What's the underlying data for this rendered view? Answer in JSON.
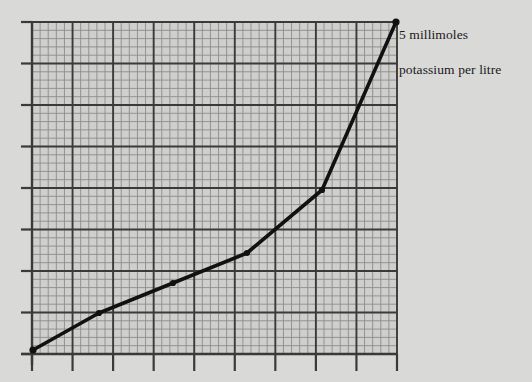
{
  "figure": {
    "background_color": "#d9d9d7",
    "grid_fill_color": "#cfcfcd",
    "major_grid_color": "#3a3a3a",
    "minor_grid_color": "#8c8c8a",
    "curve_color": "#111111",
    "annotation_lines": [
      "5 millimoles",
      "potassium per litre"
    ]
  },
  "chart_data": {
    "type": "line",
    "title": "",
    "xlabel": "",
    "ylabel": "",
    "annotation": "5 millimoles potassium per litre",
    "grid": true,
    "legend": "none",
    "xlim": [
      0,
      9
    ],
    "ylim": [
      0,
      8
    ],
    "major_cells_x": 9,
    "major_cells_y": 8,
    "minor_divisions_per_cell": 5,
    "x": [
      0.05,
      1.65,
      3.45,
      5.25,
      7.05,
      8.9
    ],
    "y": [
      0.1,
      0.95,
      1.7,
      2.45,
      3.95,
      8.0
    ],
    "points_px": [
      {
        "x": 33,
        "y": 350
      },
      {
        "x": 99,
        "y": 313
      },
      {
        "x": 173,
        "y": 283
      },
      {
        "x": 247,
        "y": 253
      },
      {
        "x": 322,
        "y": 190
      },
      {
        "x": 396,
        "y": 22
      }
    ],
    "series": [
      {
        "name": "potassium concentration",
        "values": [
          0.1,
          0.95,
          1.7,
          2.45,
          3.95,
          8.0
        ]
      }
    ]
  },
  "plot_area": {
    "left": 32,
    "top": 22,
    "right": 397,
    "bottom": 354
  }
}
